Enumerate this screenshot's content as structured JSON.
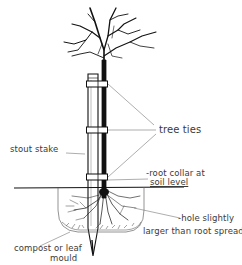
{
  "diagram": {
    "labels": {
      "tree_ties": "tree ties",
      "stout_stake": "stout stake",
      "root_collar_line1": "-root collar at",
      "root_collar_line2": "soil level",
      "hole_line1": "-hole slightly",
      "hole_line2": "larger than root spread",
      "compost_line1": "compost or leaf",
      "compost_line2": "mould"
    },
    "components": [
      "tree",
      "stake",
      "tree-tie-upper",
      "tree-tie-middle",
      "tree-tie-lower",
      "ground-line",
      "planting-hole",
      "roots",
      "compost-layer"
    ],
    "colors": {
      "ink": "#111111",
      "leader": "#777777",
      "background": "#ffffff"
    }
  }
}
